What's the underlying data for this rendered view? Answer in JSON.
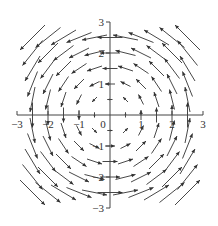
{
  "chart_data": {
    "type": "vector_field",
    "title": "",
    "xlabel": "",
    "ylabel": "",
    "field": "F(x, y) = (-y, x)",
    "xlim": [
      -3,
      3
    ],
    "ylim": [
      -3,
      3
    ],
    "x_ticks": [
      -3,
      -2,
      -1,
      0,
      1,
      2,
      3
    ],
    "y_ticks": [
      -3,
      -2,
      -1,
      1,
      2,
      3
    ],
    "x_tick_labels": [
      "-3",
      "-2",
      "-1",
      "0",
      "1",
      "2",
      "3"
    ],
    "y_tick_labels": [
      "-3",
      "-2",
      "-1",
      "1",
      "2",
      "3"
    ],
    "minor_tick_step": 0.5,
    "grid": false,
    "sample_step": 0.5,
    "sample_range": [
      -2.5,
      2.5
    ],
    "arrow_color": "#333333",
    "axis_color": "#444444",
    "origin_px": [
      110,
      115
    ],
    "unit_px": 31,
    "arrow_scale_px_per_unit": 10
  }
}
